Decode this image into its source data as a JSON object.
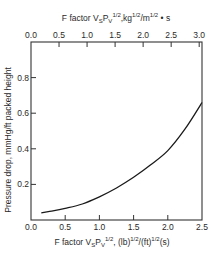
{
  "chart_data": {
    "type": "line",
    "title": "",
    "xlabel": "F factor V_S P_V^1/2, (lb)^1/2/(ft)^1/2(s)",
    "x2label": "F factor V_S P_V^1/2, kg^1/2/m^1/2 · s",
    "ylabel": "Pressure drop, mmHg/ft packed height",
    "xlim": [
      0.0,
      2.5
    ],
    "x2lim": [
      0.0,
      3.05
    ],
    "ylim": [
      0.0,
      1.0
    ],
    "grid": false,
    "legend": null,
    "x_ticks": [
      "0.0",
      "0.5",
      "1.0",
      "1.5",
      "2.0",
      "2.5"
    ],
    "x2_ticks": [
      "0.0",
      "0.5",
      "1.0",
      "1.5",
      "2.0",
      "2.5",
      "3.0"
    ],
    "y_ticks": [
      "0.2",
      "0.4",
      "0.6",
      "0.8"
    ],
    "series": [
      {
        "name": "Pressure drop",
        "x": [
          0.15,
          0.3,
          0.5,
          0.75,
          1.0,
          1.25,
          1.5,
          1.75,
          2.0,
          2.25,
          2.5
        ],
        "y": [
          0.04,
          0.05,
          0.065,
          0.09,
          0.13,
          0.18,
          0.24,
          0.31,
          0.39,
          0.51,
          0.66
        ]
      }
    ]
  },
  "labels": {
    "top_axis_title_main": "F factor V",
    "top_axis_title_sub": "S",
    "top_axis_title_p": "P",
    "top_axis_title_psub": "V",
    "top_axis_title_exp": "1/2",
    "top_axis_title_units": ",kg",
    "top_axis_title_units_exp1": "1/2",
    "top_axis_title_units2": "/m",
    "top_axis_title_units_exp2": "1/2",
    "top_axis_title_units3": " • s",
    "bottom_axis_title_main": "F factor V",
    "bottom_axis_title_sub": "S",
    "bottom_axis_title_p": "P",
    "bottom_axis_title_psub": "V",
    "bottom_axis_title_exp": "1/2",
    "bottom_axis_title_units": ", (lb)",
    "bottom_axis_title_units_exp1": "1/2",
    "bottom_axis_title_units2": "/(ft)",
    "bottom_axis_title_units_exp2": "1/2",
    "bottom_axis_title_units3": "(s)",
    "y_axis_title": "Pressure drop, mmHg/ft packed height"
  },
  "colors": {
    "line": "#1a1a1a",
    "axis": "#333333",
    "background": "#ffffff"
  }
}
